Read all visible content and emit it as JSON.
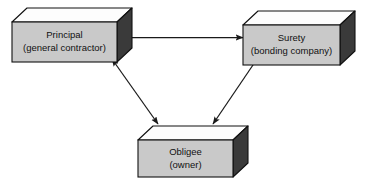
{
  "diagram": {
    "type": "block-diagram",
    "background_color": "#ffffff",
    "style": {
      "box_front_color": "#c9c9c9",
      "box_top_color": "#fdfdfd",
      "box_side_color": "#3a3a3a",
      "outline_color": "#111111",
      "arrow_color": "#1a1a1a",
      "text_color": "#111111"
    },
    "nodes": [
      {
        "id": "principal",
        "line1": "Principal",
        "line2": "(general contractor)",
        "position": "top-left"
      },
      {
        "id": "surety",
        "line1": "Surety",
        "line2": "(bonding company)",
        "position": "top-right"
      },
      {
        "id": "obligee",
        "line1": "Obligee",
        "line2": "(owner)",
        "position": "bottom-center"
      }
    ],
    "connections": [
      {
        "id": "principal-to-surety",
        "from": "principal",
        "to": "surety",
        "heads": "single",
        "orientation": "horizontal"
      },
      {
        "id": "principal-obligee",
        "from": "principal",
        "to": "obligee",
        "heads": "double",
        "orientation": "diagonal"
      },
      {
        "id": "surety-to-obligee",
        "from": "surety",
        "to": "obligee",
        "heads": "single",
        "orientation": "diagonal"
      }
    ]
  }
}
